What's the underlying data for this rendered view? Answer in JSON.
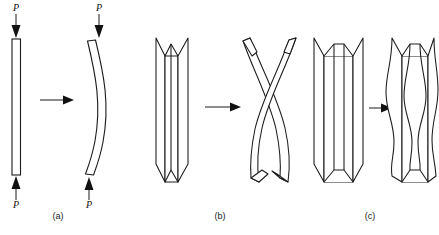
{
  "figure": {
    "background_color": "#ffffff",
    "line_color": "#1a1a1a",
    "fill_color": "#ffffff"
  },
  "panels": [
    {
      "id": "a",
      "caption": "(a)",
      "mode": "flexural-buckling",
      "before_label": "straight-column",
      "after_label": "bowed-column",
      "load_labels": {
        "top": "P",
        "bottom": "P"
      }
    },
    {
      "id": "b",
      "caption": "(b)",
      "mode": "torsional-buckling",
      "before_label": "straight-channel-section",
      "after_label": "twisted-channel-section"
    },
    {
      "id": "c",
      "caption": "(c)",
      "mode": "local-plate-buckling",
      "before_label": "straight-channel-section",
      "after_label": "locally-buckled-channel-section"
    }
  ],
  "arrows": {
    "transition_a": "→",
    "transition_b": "→",
    "transition_c": "→",
    "load_down": "↓",
    "load_up": "↑"
  }
}
